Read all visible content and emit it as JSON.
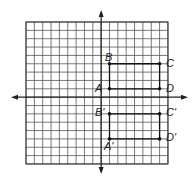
{
  "figure": {
    "grid": {
      "cols_left": 9,
      "cols_right": 8,
      "rows_above": 9,
      "rows_below": 8,
      "line_color": "#555555",
      "background": "#ffffff"
    },
    "axes": {
      "color": "#222222",
      "arrows": [
        "up",
        "down",
        "left",
        "right"
      ]
    },
    "original": {
      "points": [
        {
          "label": "A",
          "x": 1,
          "y": 1
        },
        {
          "label": "B",
          "x": 1,
          "y": 4
        },
        {
          "label": "C",
          "x": 7,
          "y": 4
        },
        {
          "label": "D",
          "x": 7,
          "y": 1
        }
      ]
    },
    "image": {
      "points": [
        {
          "label": "A'",
          "x": 1,
          "y": -5
        },
        {
          "label": "B'",
          "x": 1,
          "y": -2
        },
        {
          "label": "C'",
          "x": 7,
          "y": -2
        },
        {
          "label": "D'",
          "x": 7,
          "y": -5
        }
      ]
    },
    "labels": {
      "A": "A",
      "B": "B",
      "C": "C",
      "D": "D",
      "A_prime": "A'",
      "B_prime": "B'",
      "C_prime": "C'",
      "D_prime": "D'"
    }
  }
}
